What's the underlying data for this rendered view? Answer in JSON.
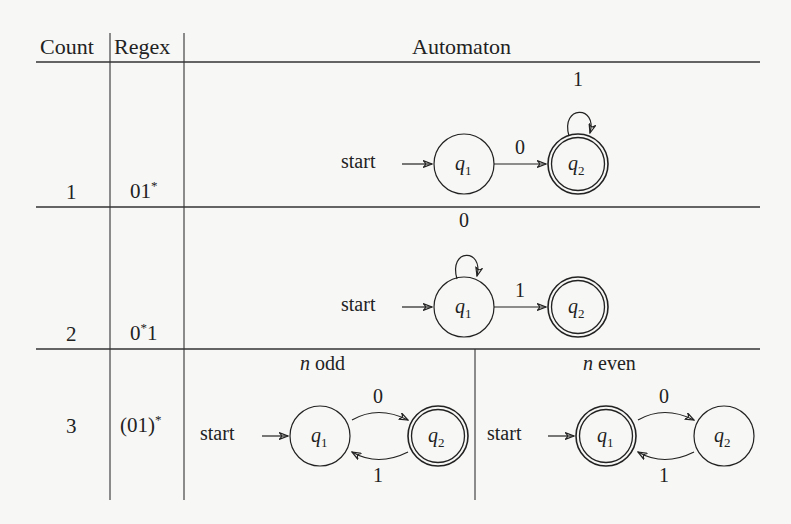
{
  "table": {
    "headers": {
      "count": "Count",
      "regex": "Regex",
      "automaton": "Automaton"
    },
    "rows": [
      {
        "count": "1",
        "regex_base": "01",
        "regex_sup": "*",
        "automaton": {
          "start_label": "start",
          "states": [
            {
              "name": "q",
              "sub": "1",
              "accepting": false
            },
            {
              "name": "q",
              "sub": "2",
              "accepting": true
            }
          ],
          "transitions": [
            {
              "from": "q1",
              "to": "q2",
              "label": "0"
            },
            {
              "from": "q2",
              "to": "q2",
              "label": "1"
            }
          ]
        }
      },
      {
        "count": "2",
        "regex_base": "0",
        "regex_sup": "*",
        "regex_tail": "1",
        "automaton": {
          "start_label": "start",
          "states": [
            {
              "name": "q",
              "sub": "1",
              "accepting": false
            },
            {
              "name": "q",
              "sub": "2",
              "accepting": true
            }
          ],
          "transitions": [
            {
              "from": "q1",
              "to": "q1",
              "label": "0"
            },
            {
              "from": "q1",
              "to": "q2",
              "label": "1"
            }
          ]
        }
      },
      {
        "count": "3",
        "regex_base": "(01)",
        "regex_sup": "*",
        "automata": [
          {
            "caption_var": "n",
            "caption_text": " odd",
            "start_label": "start",
            "states": [
              {
                "name": "q",
                "sub": "1",
                "accepting": false
              },
              {
                "name": "q",
                "sub": "2",
                "accepting": true
              }
            ],
            "transitions": [
              {
                "from": "q1",
                "to": "q2",
                "label": "0"
              },
              {
                "from": "q2",
                "to": "q1",
                "label": "1"
              }
            ]
          },
          {
            "caption_var": "n",
            "caption_text": " even",
            "start_label": "start",
            "states": [
              {
                "name": "q",
                "sub": "1",
                "accepting": true
              },
              {
                "name": "q",
                "sub": "2",
                "accepting": false
              }
            ],
            "transitions": [
              {
                "from": "q1",
                "to": "q2",
                "label": "0"
              },
              {
                "from": "q2",
                "to": "q1",
                "label": "1"
              }
            ]
          }
        ]
      }
    ]
  },
  "colors": {
    "ink": "#222222",
    "paper": "#f7f7f5"
  }
}
